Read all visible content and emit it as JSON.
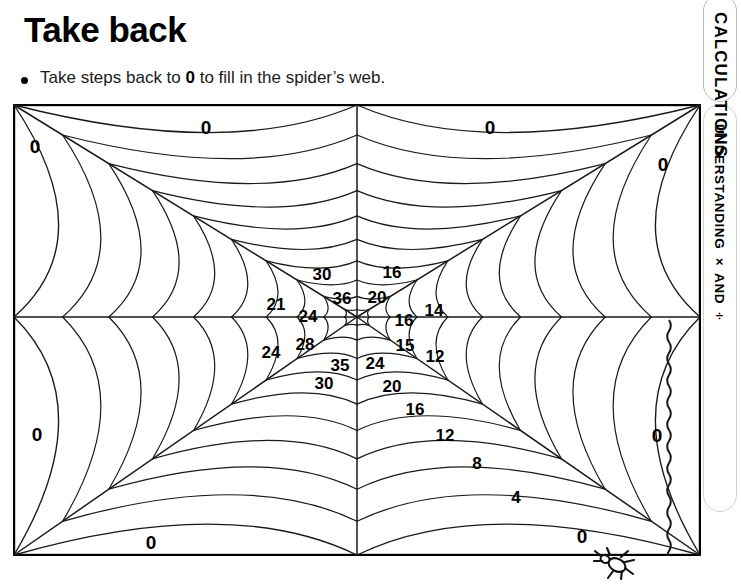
{
  "page": {
    "title": "Take back",
    "instruction_pre": "Take steps back to ",
    "instruction_bold": "0",
    "instruction_post": " to fill in the spider’s web."
  },
  "sidebar": {
    "tab_label": "CALCULATIONS",
    "section_label": "UNDERSTANDING × AND ÷"
  },
  "chart_data": {
    "type": "diagram",
    "center": {
      "x": 344,
      "y": 213
    },
    "spokes": 8,
    "rings": 10,
    "arms": [
      {
        "name": "upper-left-outer",
        "step": 0,
        "values": [
          0
        ]
      },
      {
        "name": "upper-left",
        "step": 3,
        "values": [
          21,
          24,
          30,
          36
        ]
      },
      {
        "name": "upper-right",
        "step": 4,
        "values": [
          16,
          20,
          16,
          14
        ]
      },
      {
        "name": "left",
        "step": 4,
        "values": [
          24,
          28,
          24,
          0
        ]
      },
      {
        "name": "right",
        "step": 3,
        "values": [
          15,
          12
        ]
      },
      {
        "name": "lower-left",
        "step": 5,
        "values": [
          35,
          30,
          0
        ]
      },
      {
        "name": "lower-right",
        "step": 4,
        "values": [
          24,
          20,
          16,
          12,
          8,
          4,
          0
        ]
      }
    ],
    "zeros": [
      {
        "label": "0",
        "x": 22,
        "y": 42,
        "where": "top-left-corner"
      },
      {
        "label": "0",
        "x": 193,
        "y": 23,
        "where": "top-left-of-centre"
      },
      {
        "label": "0",
        "x": 477,
        "y": 23,
        "where": "top-right-of-centre"
      },
      {
        "label": "0",
        "x": 650,
        "y": 60,
        "where": "right-upper"
      },
      {
        "label": "0",
        "x": 24,
        "y": 330,
        "where": "left-lower"
      },
      {
        "label": "0",
        "x": 644,
        "y": 331,
        "where": "right-lower"
      },
      {
        "label": "0",
        "x": 138,
        "y": 438,
        "where": "bottom-left"
      },
      {
        "label": "0",
        "x": 569,
        "y": 432,
        "where": "bottom-right"
      }
    ],
    "numbers": [
      {
        "label": "30",
        "x": 309,
        "y": 170
      },
      {
        "label": "16",
        "x": 379,
        "y": 168
      },
      {
        "label": "36",
        "x": 329,
        "y": 194
      },
      {
        "label": "20",
        "x": 364,
        "y": 193
      },
      {
        "label": "21",
        "x": 263,
        "y": 200
      },
      {
        "label": "24",
        "x": 295,
        "y": 212
      },
      {
        "label": "16",
        "x": 391,
        "y": 216
      },
      {
        "label": "14",
        "x": 421,
        "y": 206
      },
      {
        "label": "24",
        "x": 258,
        "y": 248
      },
      {
        "label": "28",
        "x": 292,
        "y": 240
      },
      {
        "label": "35",
        "x": 327,
        "y": 261
      },
      {
        "label": "24",
        "x": 362,
        "y": 259
      },
      {
        "label": "15",
        "x": 392,
        "y": 241
      },
      {
        "label": "12",
        "x": 422,
        "y": 252
      },
      {
        "label": "30",
        "x": 311,
        "y": 279
      },
      {
        "label": "20",
        "x": 379,
        "y": 282
      },
      {
        "label": "16",
        "x": 402,
        "y": 305
      },
      {
        "label": "12",
        "x": 432,
        "y": 331
      },
      {
        "label": "8",
        "x": 464,
        "y": 359
      },
      {
        "label": "4",
        "x": 503,
        "y": 393
      }
    ]
  }
}
